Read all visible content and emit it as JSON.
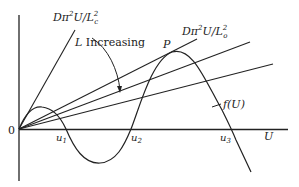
{
  "figure": {
    "labels": {
      "origin": "0",
      "x_axis": "U",
      "line_c": {
        "prefix": "Dπ",
        "sup": "2",
        "mid": "U/L",
        "sub": "c",
        "sup2": "2"
      },
      "line_o": {
        "prefix": "Dπ",
        "sup": "2",
        "mid": "U/L",
        "sub": "o",
        "sup2": "2"
      },
      "increasing": {
        "var": "L",
        "text": " Increasing"
      },
      "peak": "P",
      "curve": "f(U)",
      "roots": [
        {
          "base": "u",
          "sub": "1"
        },
        {
          "base": "u",
          "sub": "2"
        },
        {
          "base": "u",
          "sub": "3"
        }
      ]
    },
    "colors": {
      "ink": "#222222",
      "background": "#ffffff"
    }
  }
}
